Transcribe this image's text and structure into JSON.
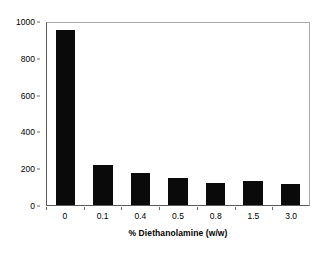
{
  "chart_data": {
    "type": "bar",
    "title": "",
    "subtitle": "",
    "xlabel": "% Diethanolamine (w/w)",
    "ylabel": "Mean Droplet Size (nm)",
    "categories": [
      "0",
      "0.1",
      "0.4",
      "0.5",
      "0.8",
      "1.5",
      "3.0"
    ],
    "values": [
      950,
      220,
      175,
      148,
      122,
      129,
      114
    ],
    "ylim": [
      0,
      1000
    ],
    "yticks": [
      0,
      200,
      400,
      600,
      800,
      1000
    ],
    "ytick_labels": [
      "0",
      "200",
      "400",
      "600",
      "800",
      "1000"
    ],
    "grid": false,
    "legend": false,
    "legend_position": "none",
    "bar_color": "#0a0a0a",
    "axis_color": "#5a5a5a",
    "frame_color": "#a8a8a8"
  }
}
